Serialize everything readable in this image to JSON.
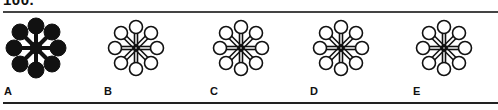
{
  "question": {
    "number": "100."
  },
  "options": [
    {
      "label": "A",
      "style": "solid",
      "twist": 0
    },
    {
      "label": "B",
      "style": "outline",
      "twist": 1
    },
    {
      "label": "C",
      "style": "outline",
      "twist": 1
    },
    {
      "label": "D",
      "style": "outline",
      "twist": -1
    },
    {
      "label": "E",
      "style": "outline",
      "twist": 1
    }
  ],
  "colors": {
    "ink": "#111111",
    "background": "#ffffff"
  }
}
